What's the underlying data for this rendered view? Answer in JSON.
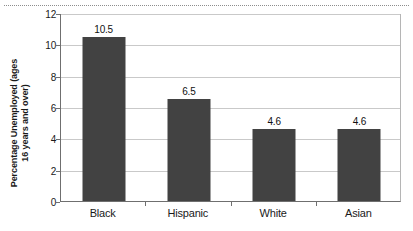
{
  "chart_data": {
    "type": "bar",
    "title": "",
    "subtitle": "",
    "xlabel": "",
    "ylabel_line1": "Percentage Unemployed (ages",
    "ylabel_line2": "16 years and over)",
    "ylabel": "Percentage Unemployed (ages 16 years and over)",
    "categories": [
      "Black",
      "Hispanic",
      "White",
      "Asian"
    ],
    "values": [
      10.5,
      6.5,
      4.6,
      4.6
    ],
    "data_labels": [
      "10.5",
      "6.5",
      "4.6",
      "4.6"
    ],
    "ylim": [
      0,
      12
    ],
    "ytick_values": [
      0,
      2,
      4,
      6,
      8,
      10,
      12
    ],
    "ytick_labels": [
      "0",
      "2",
      "4",
      "6",
      "8",
      "10",
      "12"
    ],
    "grid": true,
    "grid_orientation": "horizontal",
    "legend": false,
    "legend_position": "none",
    "bar_color": "#424242",
    "gridline_color": "#c9c9c9",
    "axis_color": "#6f6f6f",
    "background_color": "#ffffff",
    "text_color": "#1a1a1a"
  }
}
